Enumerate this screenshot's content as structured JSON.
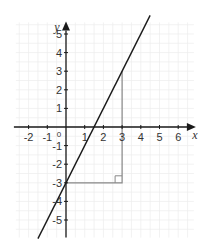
{
  "chart_data": {
    "type": "line",
    "title": "",
    "xlabel": "x",
    "ylabel": "y",
    "xlim": [
      -3,
      7
    ],
    "ylim": [
      -6,
      6
    ],
    "grid": true,
    "origin_label": "0",
    "x_ticks": [
      -2,
      -1,
      1,
      2,
      3,
      4,
      5,
      6
    ],
    "x_tick_labels": [
      "-2",
      "-1",
      "1",
      "2",
      "3",
      "4",
      "5",
      "6"
    ],
    "y_ticks": [
      5,
      4,
      3,
      2,
      1,
      -1,
      -2,
      -3,
      -4,
      -5
    ],
    "y_tick_labels": [
      "5",
      "4",
      "3",
      "2",
      "1",
      "-1",
      "-2",
      "-3",
      "-4",
      "-5"
    ],
    "series": [
      {
        "name": "y = 2x - 3",
        "slope": 2,
        "intercept": -3,
        "x_range": [
          -1.5,
          4.5
        ],
        "color": "#1a1a1a"
      }
    ],
    "annotations": {
      "gradient_triangle": {
        "points": [
          [
            0,
            -3
          ],
          [
            3,
            -3
          ],
          [
            3,
            3
          ]
        ],
        "right_angle_at": [
          3,
          -3
        ],
        "color": "#888888"
      }
    }
  },
  "colors": {
    "axis": "#1a1a1a",
    "grid": "#ececec",
    "line": "#1a1a1a",
    "triangle": "#888888"
  }
}
